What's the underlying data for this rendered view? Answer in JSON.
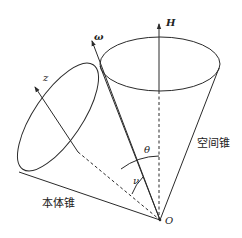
{
  "figure": {
    "labels": {
      "H": "H",
      "omega": "ω",
      "z": "z",
      "theta": "θ",
      "nu": "ν",
      "origin": "O",
      "body_cone": "本体锥",
      "space_cone": "空间锥"
    },
    "elements": [
      {
        "id": "space-cone",
        "type": "cone",
        "label": "空间锥",
        "axis": "H"
      },
      {
        "id": "body-cone",
        "type": "cone",
        "label": "本体锥",
        "axis": "z"
      },
      {
        "id": "H-axis",
        "type": "arrow",
        "label": "H"
      },
      {
        "id": "omega-axis",
        "type": "arrow",
        "label": "ω"
      },
      {
        "id": "z-axis",
        "type": "arrow",
        "label": "z"
      },
      {
        "id": "theta-angle",
        "type": "angle-arc",
        "label": "θ",
        "between": [
          "H",
          "z"
        ]
      },
      {
        "id": "nu-angle",
        "type": "angle-arc",
        "label": "ν",
        "between": [
          "ω",
          "z"
        ]
      }
    ],
    "colors": {
      "stroke": "#2a2a2a",
      "background": "#ffffff"
    }
  }
}
